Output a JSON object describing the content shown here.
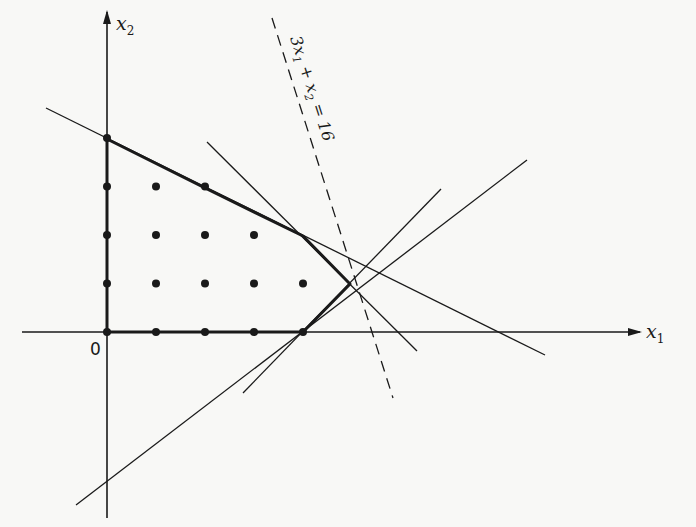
{
  "diagram": {
    "title": "",
    "type": "integer programming feasible region with cutting planes",
    "colors": {
      "ink": "#1a1a1a",
      "background": "#f8f8f6"
    },
    "axes": {
      "x_label": "x",
      "x_sub": "1",
      "y_label": "x",
      "y_sub": "2",
      "origin_label": "0"
    },
    "constraint_label": {
      "text_a": "3x",
      "sub_a": "1",
      "text_b": " + x",
      "sub_b": "2",
      "text_c": " = 16"
    },
    "lattice_points": [
      [
        0,
        0
      ],
      [
        1,
        0
      ],
      [
        2,
        0
      ],
      [
        3,
        0
      ],
      [
        4,
        0
      ],
      [
        0,
        1
      ],
      [
        1,
        1
      ],
      [
        2,
        1
      ],
      [
        3,
        1
      ],
      [
        4,
        1
      ],
      [
        0,
        2
      ],
      [
        1,
        2
      ],
      [
        2,
        2
      ],
      [
        3,
        2
      ],
      [
        0,
        3
      ],
      [
        1,
        3
      ],
      [
        2,
        3
      ],
      [
        0,
        4
      ]
    ],
    "hull_vertices": [
      [
        0,
        4
      ],
      [
        2,
        3
      ],
      [
        4,
        2
      ],
      [
        5,
        1
      ],
      [
        4,
        0
      ],
      [
        0,
        0
      ]
    ]
  }
}
